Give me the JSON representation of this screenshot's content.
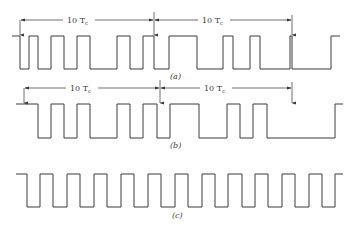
{
  "figure": {
    "panels": [
      {
        "id": "a",
        "label": "(a)",
        "dimension_label_1": "10 T",
        "dimension_label_1_sub": "c",
        "dimension_label_2": "10 T",
        "dimension_label_2_sub": "c",
        "high_y": 36,
        "low_y": 69,
        "points": "12,36 20,36 20,69 29,69 29,36 38,36 38,69 51,69 51,36 64,36 64,69 77,69 77,36 90,36 90,69 117,69 117,36 130,36 130,69 143,69 143,36 154,36 154,69 169,69 169,36 197,36 197,69 223,69 223,36 233,36 233,69 250,69 250,36 260,36 260,69 290,69 290,36 292,36 292,69 331,69 331,36 340,36"
      },
      {
        "id": "b",
        "label": "(b)",
        "dimension_label_1": "10 T",
        "dimension_label_1_sub": "c",
        "dimension_label_2": "10 T",
        "dimension_label_2_sub": "c",
        "high_y": 104,
        "low_y": 138,
        "points": "16,104 38,104 38,138 51,138 51,104 64,104 64,138 77,138 77,104 90,104 90,138 117,138 117,104 130,104 130,138 143,138 143,104 157,104 157,138 170,138 170,104 199,104 199,138 227,138 227,104 240,104 240,138 253,138 253,104 267,104 267,138 335,138 335,104 343,104"
      },
      {
        "id": "c",
        "label": "(c)",
        "high_y": 174,
        "low_y": 207,
        "points": "16,174 27,174 27,207 40,207 40,174 53,174 53,207 67,207 67,174 80,174 80,207 94,207 94,174 107,174 107,207 121,207 121,174 134,174 134,207 148,207 148,174 161,174 161,207 175,207 175,174 188,174 188,207 202,207 202,174 215,174 215,207 228,207 228,174 242,174 242,207 255,207 255,174 268,174 268,207 282,207 282,174 295,174 295,207 309,207 309,174 322,174 322,207 335,207 335,174 343,174"
      }
    ],
    "dimensions": [
      {
        "panel": "a",
        "y": 20,
        "x1": 20,
        "x2": 154,
        "label_x": 79
      },
      {
        "panel": "a",
        "y": 20,
        "x1": 154,
        "x2": 292,
        "label_x": 214
      },
      {
        "panel": "b",
        "y": 88,
        "x1": 24,
        "x2": 160,
        "label_x": 82
      },
      {
        "panel": "b",
        "y": 88,
        "x1": 160,
        "x2": 292,
        "label_x": 216
      }
    ],
    "markers": [
      {
        "panel": "a",
        "x": 20,
        "y_top": 20,
        "y_bottom": 35
      },
      {
        "panel": "a",
        "x": 154,
        "y_top": 12,
        "y_bottom": 35
      },
      {
        "panel": "a",
        "x": 292,
        "y_top": 15,
        "y_bottom": 35
      },
      {
        "panel": "b",
        "x": 24,
        "y_top": 88,
        "y_bottom": 103
      },
      {
        "panel": "b",
        "x": 160,
        "y_top": 80,
        "y_bottom": 103
      },
      {
        "panel": "b",
        "x": 292,
        "y_top": 82,
        "y_bottom": 103
      }
    ],
    "panel_labels": [
      {
        "panel": "a",
        "text": "(a)",
        "x": 170,
        "y": 79
      },
      {
        "panel": "b",
        "text": "(b)",
        "x": 170,
        "y": 148
      },
      {
        "panel": "c",
        "text": "(c)",
        "x": 172,
        "y": 218
      }
    ]
  }
}
